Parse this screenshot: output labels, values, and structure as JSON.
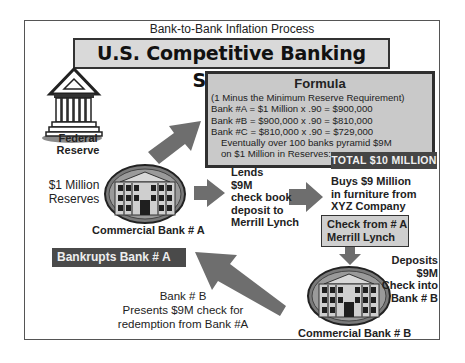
{
  "header": {
    "subtitle": "Bank-to-Bank Inflation Process",
    "title": "U.S. Competitive Banking System"
  },
  "formula": {
    "title": "Formula",
    "lines": [
      "(1 Minus the Minimum Reserve Requirement)",
      "Bank #A = $1 Million x .90 = $900,000",
      "Bank #B = $900,000 x .90 = $810,000",
      "Bank #C = $810,000 x .90 = $729,000",
      "Eventually over 100 banks pyramid $9M",
      "on  $1 Million in Reserves:"
    ],
    "total": "TOTAL $10 MILLION"
  },
  "federal_reserve": {
    "label_line1": "Federal",
    "label_line2": "Reserve",
    "icon": "federal-reserve-building-icon"
  },
  "reserves": {
    "line1": "$1 Million",
    "line2": "Reserves"
  },
  "bank_a": {
    "label": "Commercial Bank # A",
    "icon": "bank-building-icon"
  },
  "lends": {
    "lines": [
      "Lends",
      "$9M",
      "check book",
      "deposit to",
      "Merrill Lynch"
    ]
  },
  "buys": {
    "lines": [
      "Buys $9 Million",
      "in furniture from",
      "XYZ Company"
    ]
  },
  "check_box": {
    "line1": "Check from # A",
    "line2": "Merrill Lynch"
  },
  "deposits": {
    "lines": [
      "Deposits $9M",
      "Check into",
      "Bank # B"
    ]
  },
  "bank_b": {
    "label": "Commercial Bank # B",
    "icon": "bank-building-icon"
  },
  "bankrupts": {
    "label": "Bankrupts Bank # A"
  },
  "presents": {
    "lines": [
      "Bank # B",
      "Presents $9M check for",
      "redemption from Bank #A"
    ]
  },
  "colors": {
    "arrow": "#6e6e6e",
    "dark_badge": "#454545",
    "box_fill": "#c9c9c9",
    "title_fill": "#d9d9d9"
  }
}
